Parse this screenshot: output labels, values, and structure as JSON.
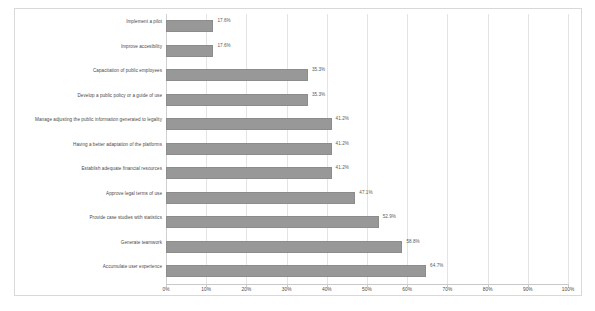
{
  "chart_data": {
    "type": "bar",
    "orientation": "horizontal",
    "title": "",
    "xlabel": "",
    "ylabel": "",
    "xlim": [
      0,
      100
    ],
    "xtick_labels": [
      "0%",
      "10%",
      "20%",
      "30%",
      "40%",
      "50%",
      "60%",
      "70%",
      "80%",
      "90%",
      "100%"
    ],
    "xtick_values": [
      0,
      10,
      20,
      30,
      40,
      50,
      60,
      70,
      80,
      90,
      100
    ],
    "grid": true,
    "legend": "none",
    "bar_color": "#989898",
    "categories": [
      "Implement a pilot",
      "Improve accesibility",
      "Capacitation of public employees",
      "Develop a public policy or a guide of use",
      "Manage adjusting the public information generated to legality",
      "Having a better adaptation of the platforms",
      "Establish adequate financial resources",
      "Approve legal terms of use",
      "Provide case studies with statistics",
      "Generate teamwork",
      "Accumulate user experience"
    ],
    "values": [
      17.6,
      17.6,
      35.3,
      35.3,
      41.2,
      41.2,
      41.2,
      47.1,
      52.9,
      58.8,
      64.7
    ],
    "value_labels": [
      "17.6%",
      "17.6%",
      "35.3%",
      "35.3%",
      "41.2%",
      "41.2%",
      "41.2%",
      "47.1%",
      "52.9%",
      "58.8%",
      "64.7%"
    ],
    "bar_draw_fraction": [
      11.8,
      11.8,
      35.3,
      35.3,
      41.2,
      41.2,
      41.2,
      47.1,
      52.9,
      58.8,
      64.7
    ]
  }
}
